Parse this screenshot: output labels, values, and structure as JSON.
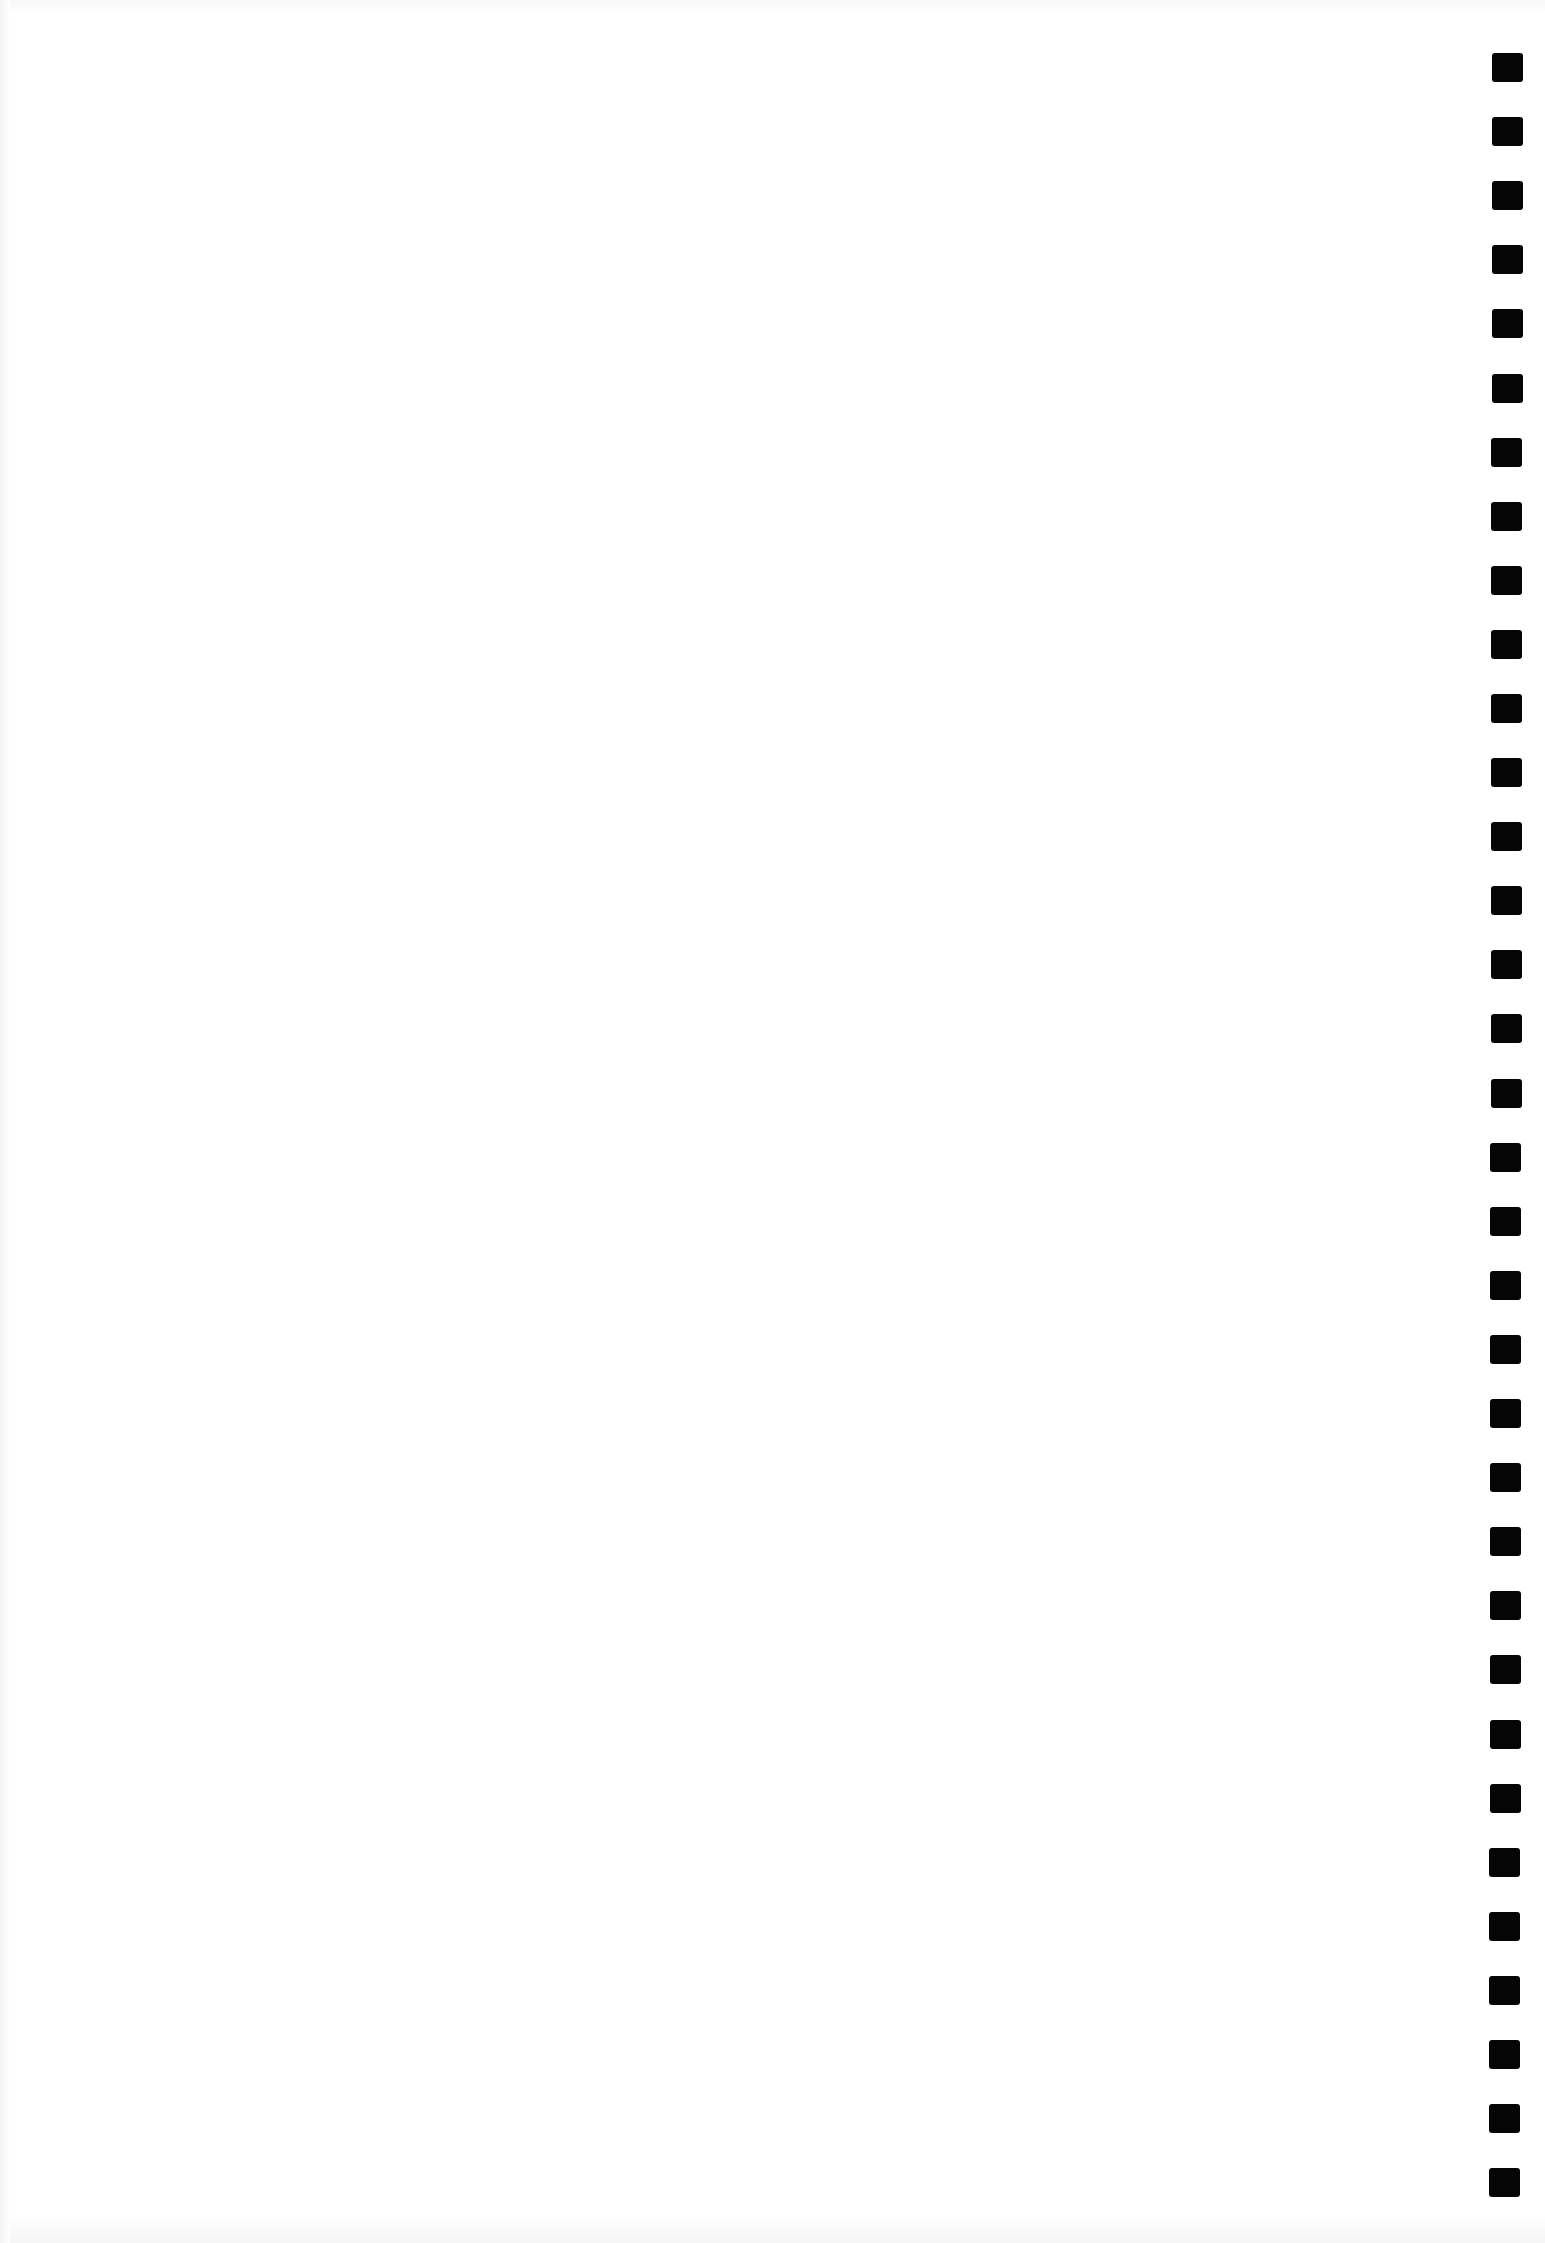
{
  "page": {
    "type": "blank scanned form sheet",
    "background_color": "#ffffff"
  },
  "timing_marks": {
    "count": 34,
    "color": "#050505",
    "first_top_px": 53,
    "spacing_px": 64.1,
    "width_px": 31,
    "height_px": 29,
    "position": "right edge column"
  }
}
